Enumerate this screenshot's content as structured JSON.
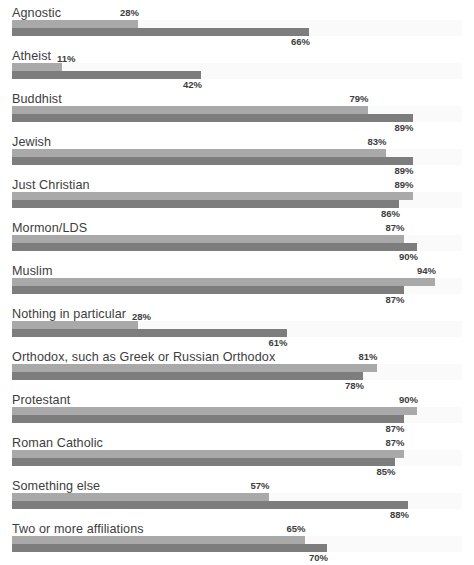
{
  "header": {
    "clipped_text": ""
  },
  "chart_data": {
    "type": "bar",
    "title": "",
    "subtitle": "",
    "xlabel": "",
    "ylabel": "",
    "xlim": [
      0,
      100
    ],
    "grid": false,
    "legend_position": "none",
    "orientation": "horizontal",
    "value_suffix": "%",
    "categories": [
      "Agnostic",
      "Atheist",
      "Buddhist",
      "Jewish",
      "Just Christian",
      "Mormon/LDS",
      "Muslim",
      "Nothing in particular",
      "Orthodox, such as Greek or Russian Orthodox",
      "Protestant",
      "Roman Catholic",
      "Something else",
      "Two or more affiliations"
    ],
    "series": [
      {
        "name": "series-1",
        "color": "#a9a9a9",
        "values": [
          28,
          11,
          79,
          83,
          89,
          87,
          94,
          28,
          81,
          90,
          87,
          57,
          65
        ],
        "labels": [
          "28%",
          "11%",
          "79%",
          "83%",
          "89%",
          "87%",
          "94%",
          "28%",
          "81%",
          "90%",
          "87%",
          "57%",
          "65%"
        ]
      },
      {
        "name": "series-2",
        "color": "#7d7d7d",
        "values": [
          66,
          42,
          89,
          89,
          86,
          90,
          87,
          61,
          78,
          87,
          85,
          88,
          70
        ],
        "labels": [
          "66%",
          "42%",
          "89%",
          "89%",
          "86%",
          "90%",
          "87%",
          "61%",
          "78%",
          "87%",
          "85%",
          "88%",
          "70%"
        ]
      }
    ],
    "rows": [
      {
        "label": "Agnostic",
        "top_value": 28,
        "top_label": "28%",
        "bottom_value": 66,
        "bottom_label": "66%",
        "top_label_inline": false
      },
      {
        "label": "Atheist",
        "top_value": 11,
        "top_label": "11%",
        "bottom_value": 42,
        "bottom_label": "42%",
        "top_label_inline": true
      },
      {
        "label": "Buddhist",
        "top_value": 79,
        "top_label": "79%",
        "bottom_value": 89,
        "bottom_label": "89%",
        "top_label_inline": false
      },
      {
        "label": "Jewish",
        "top_value": 83,
        "top_label": "83%",
        "bottom_value": 89,
        "bottom_label": "89%",
        "top_label_inline": false
      },
      {
        "label": "Just Christian",
        "top_value": 89,
        "top_label": "89%",
        "bottom_value": 86,
        "bottom_label": "86%",
        "top_label_inline": false
      },
      {
        "label": "Mormon/LDS",
        "top_value": 87,
        "top_label": "87%",
        "bottom_value": 90,
        "bottom_label": "90%",
        "top_label_inline": false
      },
      {
        "label": "Muslim",
        "top_value": 94,
        "top_label": "94%",
        "bottom_value": 87,
        "bottom_label": "87%",
        "top_label_inline": false
      },
      {
        "label": "Nothing in particular",
        "top_value": 28,
        "top_label": "28%",
        "bottom_value": 61,
        "bottom_label": "61%",
        "top_label_inline": true
      },
      {
        "label": "Orthodox, such as Greek or Russian Orthodox",
        "top_value": 81,
        "top_label": "81%",
        "bottom_value": 78,
        "bottom_label": "78%",
        "top_label_inline": false
      },
      {
        "label": "Protestant",
        "top_value": 90,
        "top_label": "90%",
        "bottom_value": 87,
        "bottom_label": "87%",
        "top_label_inline": false
      },
      {
        "label": "Roman Catholic",
        "top_value": 87,
        "top_label": "87%",
        "bottom_value": 85,
        "bottom_label": "85%",
        "top_label_inline": false
      },
      {
        "label": "Something else",
        "top_value": 57,
        "top_label": "57%",
        "bottom_value": 88,
        "bottom_label": "88%",
        "top_label_inline": false
      },
      {
        "label": "Two or more affiliations",
        "top_value": 65,
        "top_label": "65%",
        "bottom_value": 70,
        "bottom_label": "70%",
        "top_label_inline": false
      }
    ],
    "colors": {
      "series_1": "#a9a9a9",
      "series_2": "#7d7d7d",
      "track": "#fafafa",
      "text": "#3d3d3d",
      "background": "#ffffff"
    }
  }
}
